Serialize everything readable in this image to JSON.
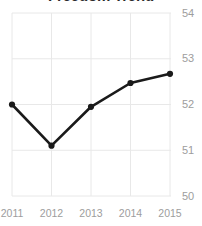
{
  "chart_data": {
    "type": "line",
    "title": "Freedom Trend",
    "xlabel": "",
    "ylabel": "",
    "categories": [
      "2011",
      "2012",
      "2013",
      "2014",
      "2015"
    ],
    "x": [
      2011,
      2012,
      2013,
      2014,
      2015
    ],
    "values": [
      52.0,
      51.1,
      51.95,
      52.47,
      52.67
    ],
    "series": [
      {
        "name": "Freedom Trend",
        "values": [
          52.0,
          51.1,
          51.95,
          52.47,
          52.67
        ],
        "color": "#1a1a1a",
        "marker": "circle",
        "line_width": 2.6
      }
    ],
    "ylim": [
      49.78,
      54.0
    ],
    "xlim": [
      2010.72,
      2015.28
    ],
    "yticks": [
      54,
      53,
      52,
      51,
      50
    ],
    "ytick_labels": [
      "54",
      "53",
      "52",
      "51",
      "50"
    ],
    "xticks": [
      2011,
      2012,
      2013,
      2014,
      2015
    ],
    "xtick_labels": [
      "2011",
      "2012",
      "2013",
      "2014",
      "2015"
    ],
    "grid": true,
    "grid_axis": "both",
    "grid_color": "#e8e8e8",
    "y_axis_side": "right",
    "legend": false,
    "legend_position": "none",
    "background": "#ffffff",
    "tick_label_color": "#9d9d9d",
    "title_color": "#2b2b2b",
    "annotations": []
  }
}
